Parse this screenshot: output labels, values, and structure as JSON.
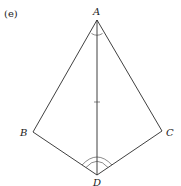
{
  "figure": {
    "part_label": "(e)",
    "vertices": {
      "A": {
        "label": "A",
        "x": 97,
        "y": 20
      },
      "B": {
        "label": "B",
        "x": 33,
        "y": 132
      },
      "C": {
        "label": "C",
        "x": 162,
        "y": 131
      },
      "D": {
        "label": "D",
        "x": 97,
        "y": 175
      }
    },
    "segments": [
      "AB",
      "AC",
      "BD",
      "CD",
      "AD"
    ],
    "markings": {
      "angle_A": "single arc (angle BAD = angle CAD)",
      "angle_D": "double arc (angle BDA = angle CDA)",
      "segment_AD": "single tick (common side)"
    }
  }
}
